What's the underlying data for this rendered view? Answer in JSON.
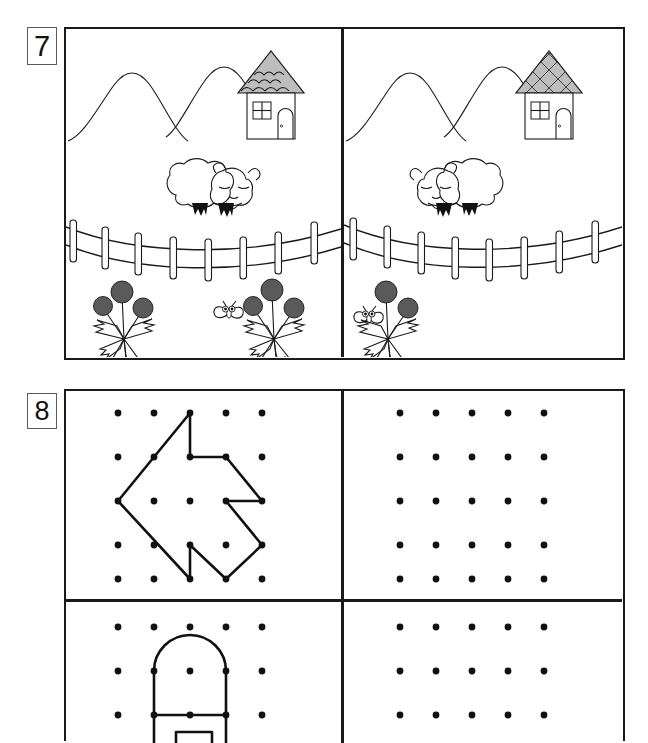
{
  "worksheet": {
    "exercises": [
      {
        "number": "7",
        "type": "spot-the-difference",
        "panels": [
          {
            "side": "left",
            "items": {
              "mountains": 2,
              "house_roof_pattern": "wavy-shingles",
              "house_window": "four-pane",
              "house_door": "arched",
              "sheep_count": 1,
              "sheep_facing": "right",
              "fence_posts": 8,
              "fence_rails": 2,
              "dandelion_plants": 2,
              "dandelion_heads": [
                3,
                3
              ],
              "butterfly_count": 1,
              "butterfly_position": "between-flowers"
            }
          },
          {
            "side": "right",
            "items": {
              "mountains": 2,
              "house_roof_pattern": "diamond-lattice",
              "house_window": "four-pane",
              "house_door": "arched",
              "sheep_count": 1,
              "sheep_facing": "left",
              "fence_posts": 8,
              "fence_rails": 2,
              "dandelion_plants": 1,
              "dandelion_heads": [
                2
              ],
              "butterfly_count": 1,
              "butterfly_position": "left-of-flower"
            }
          }
        ]
      },
      {
        "number": "8",
        "type": "copy-the-figure-on-dot-grid",
        "grid": {
          "columns": 5,
          "rows": 5
        },
        "panels": [
          {
            "position": "top-left",
            "figure": "arrow-left",
            "filled": true,
            "path_points": [
              [
                2,
                0
              ],
              [
                0,
                2
              ],
              [
                2,
                4
              ],
              [
                2,
                3
              ],
              [
                3,
                4
              ],
              [
                4,
                3
              ],
              [
                3,
                2
              ],
              [
                4,
                2
              ],
              [
                3,
                1
              ],
              [
                2,
                1
              ],
              [
                2,
                0
              ]
            ]
          },
          {
            "position": "top-right",
            "figure": "none",
            "filled": false
          },
          {
            "position": "bottom-left",
            "figure": "arched-house",
            "filled": true,
            "arch_span": [
              1,
              3
            ],
            "arch_row": 1,
            "base_row": 2
          },
          {
            "position": "bottom-right",
            "figure": "none",
            "filled": false
          }
        ]
      }
    ]
  },
  "colors": {
    "ink": "#1a1a1a",
    "roof_fill": "#b9b9b9",
    "badge_border": "#5b5b5b",
    "paper": "#ffffff"
  }
}
